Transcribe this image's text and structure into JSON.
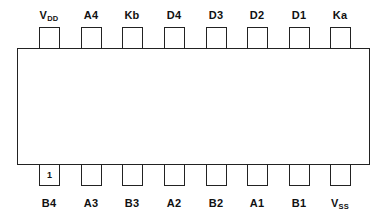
{
  "diagram": {
    "type": "ic-pinout",
    "package": "DIP-16",
    "pin1_marker": "1",
    "top_row": [
      {
        "pin": 16,
        "label": "V",
        "sub": "DD"
      },
      {
        "pin": 15,
        "label": "A4",
        "sub": ""
      },
      {
        "pin": 14,
        "label": "Kb",
        "sub": ""
      },
      {
        "pin": 13,
        "label": "D4",
        "sub": ""
      },
      {
        "pin": 12,
        "label": "D3",
        "sub": ""
      },
      {
        "pin": 11,
        "label": "D2",
        "sub": ""
      },
      {
        "pin": 10,
        "label": "D1",
        "sub": ""
      },
      {
        "pin": 9,
        "label": "Ka",
        "sub": ""
      }
    ],
    "bottom_row": [
      {
        "pin": 1,
        "label": "B4",
        "sub": ""
      },
      {
        "pin": 2,
        "label": "A3",
        "sub": ""
      },
      {
        "pin": 3,
        "label": "B3",
        "sub": ""
      },
      {
        "pin": 4,
        "label": "A2",
        "sub": ""
      },
      {
        "pin": 5,
        "label": "B2",
        "sub": ""
      },
      {
        "pin": 6,
        "label": "A1",
        "sub": ""
      },
      {
        "pin": 7,
        "label": "B1",
        "sub": ""
      },
      {
        "pin": 8,
        "label": "V",
        "sub": "SS"
      }
    ]
  }
}
